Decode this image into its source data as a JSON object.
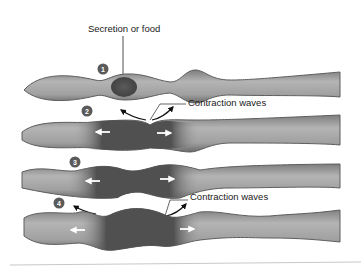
{
  "diagram": {
    "title_label": "Secretion or food",
    "steps": [
      {
        "number": "1",
        "label": ""
      },
      {
        "number": "2",
        "label": "Contraction waves"
      },
      {
        "number": "3",
        "label": ""
      },
      {
        "number": "4",
        "label": "Contraction waves"
      }
    ],
    "colors": {
      "tube_light": "#a8a8a8",
      "tube_mid": "#8a8a8a",
      "tube_dark": "#555555",
      "content_dark": "#4a4a4a",
      "badge": "#5a5a5a",
      "arrow_white": "#ffffff",
      "arrow_black": "#111111"
    }
  }
}
